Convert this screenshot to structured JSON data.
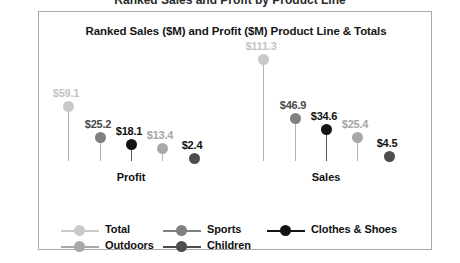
{
  "chart_data": {
    "type": "scatter",
    "variant": "lollipop",
    "title": "Ranked Sales ($M) and Profit ($M) Product Line & Totals",
    "xlabel": "",
    "ylabel": "",
    "categories": [
      "Profit",
      "Sales"
    ],
    "ylim": [
      0,
      111.3
    ],
    "grid": false,
    "legend_position": "bottom",
    "legend_columns": 3,
    "value_prefix": "$",
    "series": [
      {
        "name": "Total",
        "color": "#c9c9c9",
        "values": [
          59.1,
          111.3
        ],
        "labels": [
          "$59.1",
          "$111.3"
        ]
      },
      {
        "name": "Sports",
        "color": "#808080",
        "values": [
          25.2,
          46.9
        ],
        "labels": [
          "$25.2",
          "$46.9"
        ]
      },
      {
        "name": "Clothes & Shoes",
        "color": "#141414",
        "values": [
          18.1,
          34.6
        ],
        "labels": [
          "$18.1",
          "$34.6"
        ]
      },
      {
        "name": "Outdoors",
        "color": "#a8a8a8",
        "values": [
          13.4,
          25.4
        ],
        "labels": [
          "$13.4",
          "$25.4"
        ]
      },
      {
        "name": "Children",
        "color": "#4d4d4d",
        "values": [
          2.4,
          4.5
        ],
        "labels": [
          "$2.4",
          "$4.5"
        ]
      }
    ]
  },
  "legend": {
    "entries": [
      {
        "label": "Total",
        "color": "#c9c9c9"
      },
      {
        "label": "Sports",
        "color": "#808080"
      },
      {
        "label": "Clothes & Shoes",
        "color": "#141414"
      },
      {
        "label": "Outdoors",
        "color": "#a8a8a8"
      },
      {
        "label": "Children",
        "color": "#4d4d4d"
      }
    ]
  },
  "page": {
    "clipped_header_text": "Ranked Sales and Profit by Product Line"
  }
}
